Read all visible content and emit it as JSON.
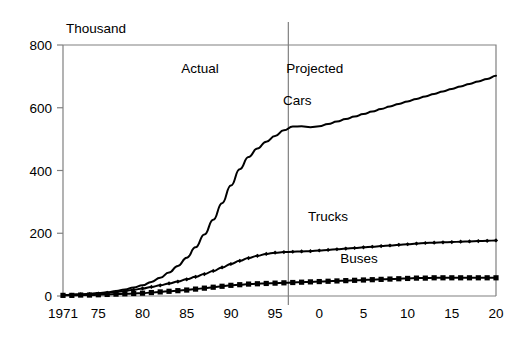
{
  "chart_data": {
    "type": "line",
    "title": "",
    "subtitle": "",
    "xlabel": "",
    "ylabel": "Thousand",
    "ylim": [
      0,
      800
    ],
    "xlim": [
      1971,
      2020
    ],
    "grid": false,
    "legend_position": "inline-labels",
    "y_ticks": [
      "0",
      "200",
      "400",
      "600",
      "800"
    ],
    "y_tick_values": [
      0,
      200,
      400,
      600,
      800
    ],
    "x_ticks": [
      "1971",
      "75",
      "80",
      "85",
      "90",
      "95",
      "0",
      "5",
      "10",
      "15",
      "20"
    ],
    "x_tick_values": [
      1971,
      1975,
      1980,
      1985,
      1990,
      1995,
      2000,
      2005,
      2010,
      2015,
      2020
    ],
    "annotations": [
      {
        "name": "actual-region-label",
        "text": "Actual",
        "x": 1986.5,
        "y": 710
      },
      {
        "name": "projected-region-label",
        "text": "Projected",
        "x": 1999.5,
        "y": 710
      },
      {
        "name": "divider-line",
        "text": "",
        "x": 1996.5,
        "y": 0
      }
    ],
    "divider_x": 1996.5,
    "series": [
      {
        "name": "Cars",
        "label": "Cars",
        "label_x": 1997.5,
        "label_y": 610,
        "marker": "none",
        "color": "#000000",
        "x": [
          1971,
          1972,
          1973,
          1974,
          1975,
          1976,
          1977,
          1978,
          1979,
          1980,
          1981,
          1982,
          1983,
          1984,
          1985,
          1986,
          1987,
          1988,
          1989,
          1990,
          1991,
          1992,
          1993,
          1994,
          1995,
          1996,
          1997,
          1998,
          1999,
          2000,
          2001,
          2002,
          2003,
          2004,
          2005,
          2006,
          2007,
          2008,
          2009,
          2010,
          2011,
          2012,
          2013,
          2014,
          2015,
          2016,
          2017,
          2018,
          2019,
          2020
        ],
        "values": [
          3,
          4,
          5,
          7,
          9,
          12,
          16,
          21,
          27,
          34,
          45,
          58,
          75,
          96,
          122,
          155,
          196,
          243,
          296,
          352,
          404,
          443,
          470,
          492,
          510,
          528,
          540,
          541,
          538,
          541,
          548,
          556,
          564,
          572,
          580,
          588,
          596,
          604,
          612,
          620,
          628,
          636,
          644,
          652,
          660,
          668,
          676,
          684,
          692,
          702
        ]
      },
      {
        "name": "Trucks",
        "label": "Trucks",
        "label_x": 2001.0,
        "label_y": 238,
        "marker": "diamond",
        "color": "#000000",
        "x": [
          1971,
          1972,
          1973,
          1974,
          1975,
          1976,
          1977,
          1978,
          1979,
          1980,
          1981,
          1982,
          1983,
          1984,
          1985,
          1986,
          1987,
          1988,
          1989,
          1990,
          1991,
          1992,
          1993,
          1994,
          1995,
          1996,
          1997,
          1998,
          1999,
          2000,
          2001,
          2002,
          2003,
          2004,
          2005,
          2006,
          2007,
          2008,
          2009,
          2010,
          2011,
          2012,
          2013,
          2014,
          2015,
          2016,
          2017,
          2018,
          2019,
          2020
        ],
        "values": [
          3,
          4,
          5,
          6,
          8,
          10,
          13,
          16,
          20,
          24,
          29,
          34,
          40,
          46,
          53,
          61,
          70,
          80,
          91,
          102,
          112,
          121,
          128,
          134,
          138,
          140,
          141,
          142,
          143,
          145,
          147,
          149,
          151,
          153,
          155,
          157,
          159,
          161,
          163,
          165,
          167,
          169,
          170,
          171,
          172,
          173,
          174,
          175,
          176,
          177
        ]
      },
      {
        "name": "Buses",
        "label": "Buses",
        "label_x": 2004.5,
        "label_y": 105,
        "marker": "square",
        "color": "#000000",
        "x": [
          1971,
          1972,
          1973,
          1974,
          1975,
          1976,
          1977,
          1978,
          1979,
          1980,
          1981,
          1982,
          1983,
          1984,
          1985,
          1986,
          1987,
          1988,
          1989,
          1990,
          1991,
          1992,
          1993,
          1994,
          1995,
          1996,
          1997,
          1998,
          1999,
          2000,
          2001,
          2002,
          2003,
          2004,
          2005,
          2006,
          2007,
          2008,
          2009,
          2010,
          2011,
          2012,
          2013,
          2014,
          2015,
          2016,
          2017,
          2018,
          2019,
          2020
        ],
        "values": [
          2,
          2,
          3,
          3,
          4,
          5,
          6,
          7,
          8,
          9,
          11,
          13,
          15,
          17,
          19,
          22,
          25,
          28,
          31,
          34,
          36,
          38,
          39,
          40,
          41,
          42,
          43,
          44,
          45,
          46,
          47,
          48,
          49,
          50,
          51,
          52,
          53,
          54,
          55,
          56,
          57,
          57,
          58,
          58,
          58,
          58,
          58,
          58,
          58,
          58
        ]
      }
    ]
  },
  "colors": {
    "series": "#000000",
    "axis": "#808080",
    "divider": "#808080",
    "background": "#ffffff"
  }
}
